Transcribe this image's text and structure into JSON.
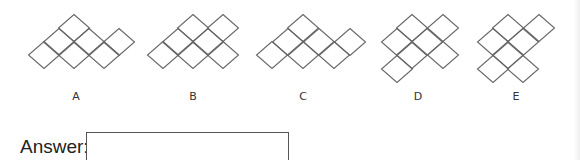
{
  "options": [
    {
      "label": "A",
      "label_x": 76,
      "cells": [
        [
          74,
          28
        ],
        [
          59,
          42
        ],
        [
          89,
          42
        ],
        [
          119,
          42
        ],
        [
          44,
          55
        ],
        [
          74,
          55
        ],
        [
          104,
          55
        ]
      ]
    },
    {
      "label": "B",
      "label_x": 193,
      "cells": [
        [
          193,
          28
        ],
        [
          223,
          28
        ],
        [
          178,
          42
        ],
        [
          208,
          42
        ],
        [
          163,
          55
        ],
        [
          193,
          55
        ],
        [
          223,
          55
        ]
      ]
    },
    {
      "label": "C",
      "label_x": 303,
      "cells": [
        [
          303,
          28
        ],
        [
          288,
          42
        ],
        [
          319,
          42
        ],
        [
          350,
          42
        ],
        [
          272,
          55
        ],
        [
          303,
          55
        ],
        [
          334,
          55
        ]
      ]
    },
    {
      "label": "D",
      "label_x": 418,
      "cells": [
        [
          412,
          28
        ],
        [
          443,
          28
        ],
        [
          397,
          42
        ],
        [
          427,
          42
        ],
        [
          412,
          55
        ],
        [
          443,
          55
        ],
        [
          397,
          69
        ]
      ]
    },
    {
      "label": "E",
      "label_x": 516,
      "cells": [
        [
          508,
          28
        ],
        [
          539,
          28
        ],
        [
          493,
          42
        ],
        [
          523,
          42
        ],
        [
          508,
          55
        ],
        [
          493,
          69
        ],
        [
          523,
          69
        ]
      ]
    }
  ],
  "cell": {
    "half_w": 15.5,
    "half_h": 13.5,
    "stroke": "#666666"
  },
  "answer": {
    "label": "Answer:",
    "value": ""
  }
}
